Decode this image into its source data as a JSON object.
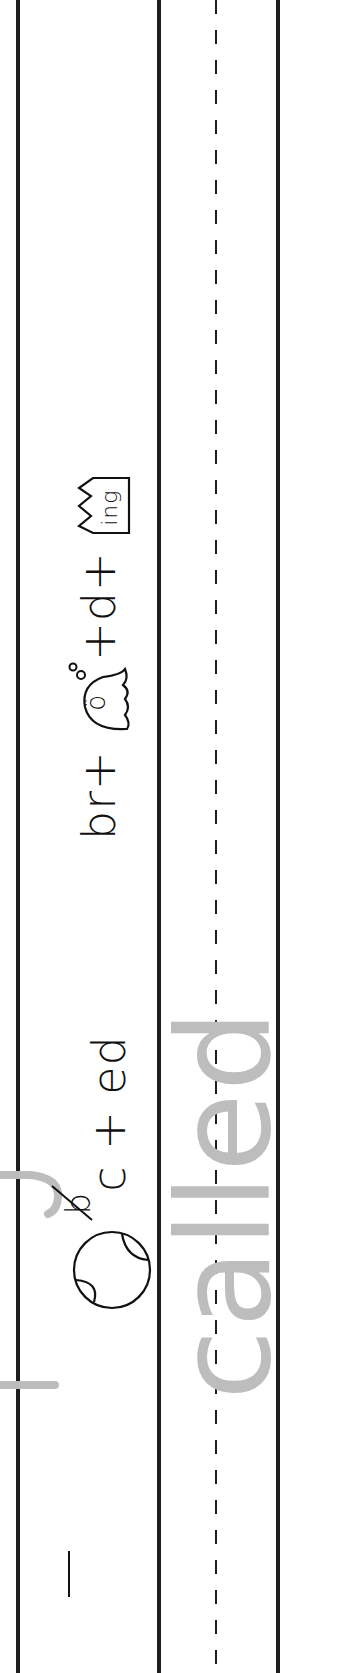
{
  "worksheet": {
    "orientation": "rotated-90-ccw",
    "colors": {
      "ink": "#1e1e1e",
      "trace_gray": "#bdbdbd",
      "background": "#ffffff"
    },
    "row1": {
      "clue_top": {
        "prefix": "br",
        "plus1": "+",
        "ghost_icon_letter": "ö",
        "plus2": "+",
        "middle": "d",
        "plus3": "+",
        "crown_icon_text": "ing"
      },
      "clue_bottom": {
        "ball_icon": "baseball",
        "crossed_letter": "b",
        "letter": "c",
        "plus": "+",
        "suffix": "ed"
      },
      "tail_mark": "|"
    },
    "row2": {
      "trace_word": "called"
    }
  }
}
